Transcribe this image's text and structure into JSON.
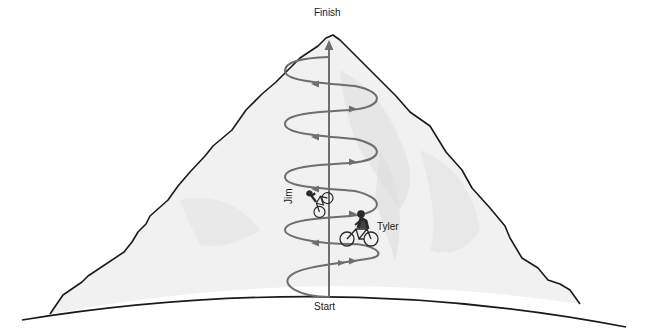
{
  "diagram": {
    "type": "physics-illustration",
    "labels": {
      "finish": "Finish",
      "start": "Start",
      "cyclist_1": "Jim",
      "cyclist_2": "Tyler"
    },
    "colors": {
      "outline": "#1a1a1a",
      "mountain_fill": "#f1f1f1",
      "mountain_shade": "#e2e2e2",
      "arrow": "#6e6e6e"
    },
    "spiral_turns": 5,
    "elements": [
      "mountain",
      "ground-curve",
      "vertical-displacement-arrow",
      "spiral-path-with-arrows",
      "cyclist-jim",
      "cyclist-tyler"
    ]
  }
}
